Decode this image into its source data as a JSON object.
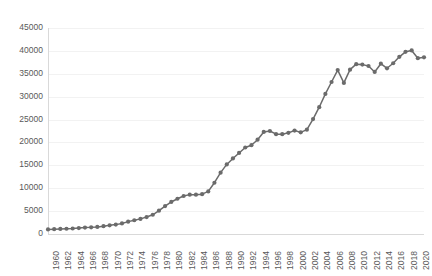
{
  "chart_data": {
    "type": "line",
    "title": "",
    "subtitle": "",
    "xlabel": "",
    "ylabel": "",
    "grid": true,
    "legend": false,
    "legend_position": "none",
    "marker": "circle",
    "line_color": "#6b6b6b",
    "marker_color": "#6b6b6b",
    "gridline_color": "#f2f2f2",
    "axis_color": "#d9d9d9",
    "text_color": "#595959",
    "xlim": [
      1960,
      2021
    ],
    "ylim": [
      0,
      45000
    ],
    "y_ticks": [
      0,
      5000,
      10000,
      15000,
      20000,
      25000,
      30000,
      35000,
      40000,
      45000
    ],
    "y_tick_labels": [
      "0",
      "5000",
      "10000",
      "15000",
      "20000",
      "25000",
      "30000",
      "35000",
      "40000",
      "45000"
    ],
    "x_ticks": [
      1960,
      1962,
      1964,
      1966,
      1968,
      1970,
      1972,
      1974,
      1976,
      1978,
      1980,
      1982,
      1984,
      1986,
      1988,
      1990,
      1992,
      1994,
      1996,
      1998,
      2000,
      2002,
      2004,
      2006,
      2008,
      2010,
      2012,
      2014,
      2016,
      2018,
      2020
    ],
    "x_tick_labels": [
      "1960",
      "1962",
      "1964",
      "1966",
      "1968",
      "1970",
      "1972",
      "1974",
      "1976",
      "1978",
      "1980",
      "1982",
      "1984",
      "1986",
      "1988",
      "1990",
      "1992",
      "1994",
      "1996",
      "1998",
      "2000",
      "2002",
      "2004",
      "2006",
      "2008",
      "2010",
      "2012",
      "2014",
      "2016",
      "2018",
      "2020"
    ],
    "x": [
      1960,
      1961,
      1962,
      1963,
      1964,
      1965,
      1966,
      1967,
      1968,
      1969,
      1970,
      1971,
      1972,
      1973,
      1974,
      1975,
      1976,
      1977,
      1978,
      1979,
      1980,
      1981,
      1982,
      1983,
      1984,
      1985,
      1986,
      1987,
      1988,
      1989,
      1990,
      1991,
      1992,
      1993,
      1994,
      1995,
      1996,
      1997,
      1998,
      1999,
      2000,
      2001,
      2002,
      2003,
      2004,
      2005,
      2006,
      2007,
      2008,
      2009,
      2010,
      2011,
      2012,
      2013,
      2014,
      2015,
      2016,
      2017,
      2018,
      2019,
      2020,
      2021
    ],
    "values": [
      1000,
      1050,
      1100,
      1150,
      1200,
      1300,
      1400,
      1450,
      1550,
      1700,
      1900,
      2050,
      2300,
      2700,
      3000,
      3300,
      3700,
      4200,
      5100,
      6100,
      7000,
      7700,
      8300,
      8600,
      8600,
      8700,
      9300,
      11200,
      13400,
      15200,
      16500,
      17700,
      18900,
      19400,
      20600,
      22300,
      22500,
      21800,
      21800,
      22100,
      22600,
      22200,
      22800,
      25100,
      27700,
      30600,
      33200,
      35800,
      33000,
      35900,
      37100,
      37000,
      36700,
      35400,
      37200,
      36200,
      37300,
      38700,
      39800,
      40100,
      38400,
      38600
    ],
    "series_name": ""
  }
}
